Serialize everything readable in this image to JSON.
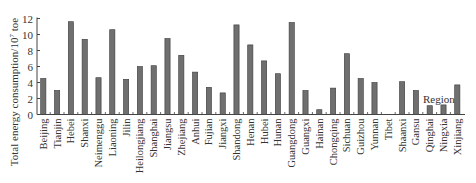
{
  "chart_data": {
    "type": "bar",
    "title": "",
    "xlabel": "Region",
    "ylabel": "Total energy consumption/10^7 toe",
    "ylabel_prefix": "Total energy consumption/10",
    "ylabel_exp": "7",
    "ylabel_suffix": " toe",
    "ylim": [
      0,
      12
    ],
    "yticks": [
      0,
      2,
      4,
      6,
      8,
      10,
      12
    ],
    "grid": false,
    "legend": null,
    "bar_color": "#6f6f6f",
    "categories": [
      "Beijing",
      "Tianjin",
      "Hebei",
      "Shanxi",
      "Neimenggu",
      "Liaoning",
      "Jilin",
      "Heilongjiang",
      "Shanghai",
      "Jiangsu",
      "Zhejiang",
      "Anhui",
      "Fujian",
      "Jiangxi",
      "Shandong",
      "Henan",
      "Hubei",
      "Hunan",
      "Guangdong",
      "Guangxi",
      "Hainan",
      "Chongqing",
      "Sichuan",
      "Guizhou",
      "Yunnan",
      "Tibet",
      "Shaanxi",
      "Gansu",
      "Qinghai",
      "Ningxia",
      "Xinjiang"
    ],
    "values": [
      4.5,
      3.0,
      11.6,
      9.4,
      4.6,
      10.6,
      4.4,
      6.0,
      6.1,
      9.5,
      7.4,
      5.3,
      3.4,
      2.7,
      11.2,
      8.7,
      6.7,
      5.1,
      11.5,
      3.0,
      0.6,
      3.3,
      7.6,
      4.5,
      4.0,
      0.0,
      4.1,
      3.0,
      1.1,
      1.2,
      3.7
    ]
  }
}
